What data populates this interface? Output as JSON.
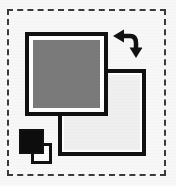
{
  "widget": {
    "name": "Color Indicator",
    "description": "Foreground and background color selector with swap and default controls",
    "background_color": "#f7f7f7"
  },
  "selection_frame": {
    "name": "Dashed selection boundary",
    "style": "dashed",
    "color": "#3a3a3a",
    "width": 2
  },
  "swatches": {
    "foreground": {
      "label": "Foreground color",
      "color": "#7a7a7a",
      "border_color": "#111111",
      "inner_border_color": "#ffffff"
    },
    "background": {
      "label": "Background color",
      "color": "#efefef",
      "border_color": "#111111",
      "inner_border_color": "#ffffff"
    }
  },
  "swap_control": {
    "label": "Swap foreground and background colors",
    "icon": "swap-arrows-icon",
    "color": "#111111"
  },
  "default_control": {
    "label": "Reset to default colors",
    "foreground_color": "#0d0d0d",
    "background_color": "#fbfbfb",
    "border_color": "#111111"
  }
}
